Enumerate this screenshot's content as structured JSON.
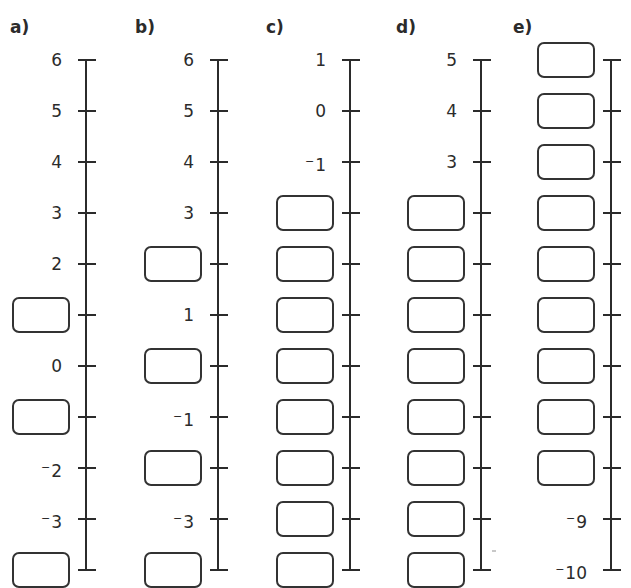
{
  "worksheet": {
    "title": "",
    "tick_spacing_px": 51,
    "columns": [
      {
        "label": "a)",
        "axis_x": 86,
        "ticks": [
          {
            "value": "6",
            "type": "number"
          },
          {
            "value": "5",
            "type": "number"
          },
          {
            "value": "4",
            "type": "number"
          },
          {
            "value": "3",
            "type": "number"
          },
          {
            "value": "2",
            "type": "number"
          },
          {
            "value": "",
            "type": "box"
          },
          {
            "value": "0",
            "type": "number"
          },
          {
            "value": "",
            "type": "box"
          },
          {
            "value": "-2",
            "type": "number"
          },
          {
            "value": "-3",
            "type": "number"
          },
          {
            "value": "",
            "type": "box"
          }
        ]
      },
      {
        "label": "b)",
        "axis_x": 218,
        "ticks": [
          {
            "value": "6",
            "type": "number"
          },
          {
            "value": "5",
            "type": "number"
          },
          {
            "value": "4",
            "type": "number"
          },
          {
            "value": "3",
            "type": "number"
          },
          {
            "value": "",
            "type": "box"
          },
          {
            "value": "1",
            "type": "number"
          },
          {
            "value": "",
            "type": "box"
          },
          {
            "value": "-1",
            "type": "number"
          },
          {
            "value": "",
            "type": "box"
          },
          {
            "value": "-3",
            "type": "number"
          },
          {
            "value": "",
            "type": "box"
          }
        ]
      },
      {
        "label": "c)",
        "axis_x": 350,
        "ticks": [
          {
            "value": "1",
            "type": "number"
          },
          {
            "value": "0",
            "type": "number"
          },
          {
            "value": "-1",
            "type": "number"
          },
          {
            "value": "",
            "type": "box"
          },
          {
            "value": "",
            "type": "box"
          },
          {
            "value": "",
            "type": "box"
          },
          {
            "value": "",
            "type": "box"
          },
          {
            "value": "",
            "type": "box"
          },
          {
            "value": "",
            "type": "box"
          },
          {
            "value": "",
            "type": "box"
          },
          {
            "value": "",
            "type": "box"
          }
        ]
      },
      {
        "label": "d)",
        "axis_x": 481,
        "ticks": [
          {
            "value": "5",
            "type": "number"
          },
          {
            "value": "4",
            "type": "number"
          },
          {
            "value": "3",
            "type": "number"
          },
          {
            "value": "",
            "type": "box"
          },
          {
            "value": "",
            "type": "box"
          },
          {
            "value": "",
            "type": "box"
          },
          {
            "value": "",
            "type": "box"
          },
          {
            "value": "",
            "type": "box"
          },
          {
            "value": "",
            "type": "box"
          },
          {
            "value": "",
            "type": "box"
          },
          {
            "value": "",
            "type": "box"
          }
        ]
      },
      {
        "label": "e)",
        "axis_x": 611,
        "ticks": [
          {
            "value": "",
            "type": "box"
          },
          {
            "value": "",
            "type": "box"
          },
          {
            "value": "",
            "type": "box"
          },
          {
            "value": "",
            "type": "box"
          },
          {
            "value": "",
            "type": "box"
          },
          {
            "value": "",
            "type": "box"
          },
          {
            "value": "",
            "type": "box"
          },
          {
            "value": "",
            "type": "box"
          },
          {
            "value": "",
            "type": "box"
          },
          {
            "value": "-9",
            "type": "number"
          },
          {
            "value": "-10",
            "type": "number"
          }
        ]
      }
    ]
  },
  "colors": {
    "ink": "#2b2b2b",
    "box_border": "#333333",
    "background": "#ffffff"
  }
}
